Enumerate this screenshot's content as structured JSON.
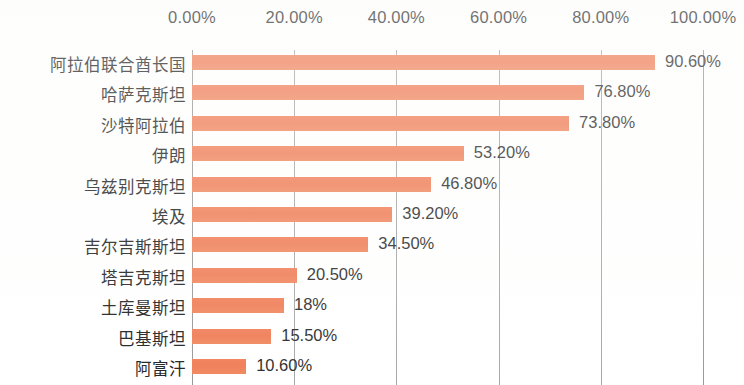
{
  "chart_data": {
    "type": "bar",
    "orientation": "horizontal",
    "title": "",
    "subtitle": "",
    "xlabel": "",
    "ylabel": "",
    "xlim": [
      0,
      100
    ],
    "grid": true,
    "legend": false,
    "axis_position": "top",
    "units": "percent",
    "bar_color": "#f0805a",
    "gridline_color": "#a8a8a8",
    "text_color": "#2f2f2f",
    "background": "#ffffff",
    "x_ticks": [
      0,
      20,
      40,
      60,
      80,
      100
    ],
    "x_tick_labels": [
      "0.00%",
      "20.00%",
      "40.00%",
      "60.00%",
      "80.00%",
      "100.00%"
    ],
    "categories": [
      "阿拉伯联合酋长国",
      "哈萨克斯坦",
      "沙特阿拉伯",
      "伊朗",
      "乌兹别克斯坦",
      "埃及",
      "吉尔吉斯斯坦",
      "塔吉克斯坦",
      "土库曼斯坦",
      "巴基斯坦",
      "阿富汗"
    ],
    "values": [
      90.6,
      76.8,
      73.8,
      53.2,
      46.8,
      39.2,
      34.5,
      20.5,
      18,
      15.5,
      10.6
    ],
    "value_labels": [
      "90.60%",
      "76.80%",
      "73.80%",
      "53.20%",
      "46.80%",
      "39.20%",
      "34.50%",
      "20.50%",
      "18%",
      "15.50%",
      "10.60%"
    ]
  }
}
